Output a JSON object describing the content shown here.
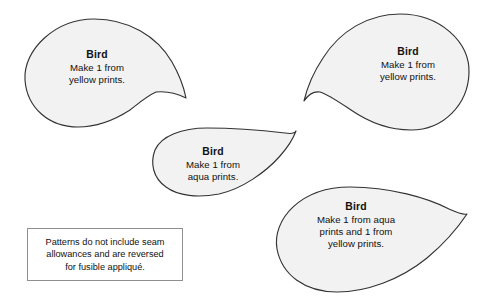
{
  "document": {
    "title": "Bird Appliqué Pattern Sheet",
    "background_color": "#ffffff"
  },
  "style": {
    "piece_fill": "#f2f2f2",
    "piece_outline": "#333333",
    "note_border": "#8f8f8f",
    "text_color": "#111111"
  },
  "pieces": [
    {
      "id": "piece-1",
      "shape": "teardrop-paisley",
      "orientation": "bulb-left-tail-right",
      "title": "Bird",
      "lines": [
        "Make 1 from",
        "yellow prints."
      ],
      "path": "M 94 19 C 128 19 157 36 172 62 C 180 76 184 88 186 98 C 176 93 165 91 156 92 C 147 96 139 103 130 110 C 113 121 95 127 78 127 C 49 127 27 108 25 80 C 23 50 55 19 94 19 Z"
    },
    {
      "id": "piece-2",
      "shape": "teardrop-paisley",
      "orientation": "bulb-right-tail-left",
      "title": "Bird",
      "lines": [
        "Make 1 from",
        "yellow prints."
      ],
      "path": "M 400 14 C 440 14 470 42 469 73 C 468 104 444 130 411 130 C 391 130 370 123 351 110 C 339 102 329 95 320 92 C 313 91 308 95 304 101 C 307 88 313 73 323 58 C 340 31 368 14 400 14 Z"
    },
    {
      "id": "piece-3",
      "shape": "teardrop-paisley",
      "orientation": "bulb-left-tail-upper-right",
      "title": "Bird",
      "lines": [
        "Make 1 from",
        "aqua prints."
      ],
      "path": "M 207 128 C 240 128 268 131 285 133 C 291 134 295 133 296 131 C 293 139 288 147 280 156 C 266 172 242 189 219 194 C 198 198 178 196 166 187 C 153 178 150 163 155 150 C 161 136 182 128 207 128 Z"
    },
    {
      "id": "piece-4",
      "shape": "teardrop-paisley",
      "orientation": "bulb-left-tail-right",
      "title": "Bird",
      "lines": [
        "Make 1 from aqua",
        "prints and 1 from",
        "yellow prints."
      ],
      "path": "M 350 187 C 390 187 428 198 449 209 C 458 213 464 215 467 214 C 459 226 445 243 427 258 C 400 280 366 292 337 292 C 305 292 282 275 277 249 C 272 220 300 187 350 187 Z"
    }
  ],
  "note": {
    "lines": [
      "Patterns do not include seam",
      "allowances and are reversed",
      "for fusible appliqué."
    ]
  }
}
